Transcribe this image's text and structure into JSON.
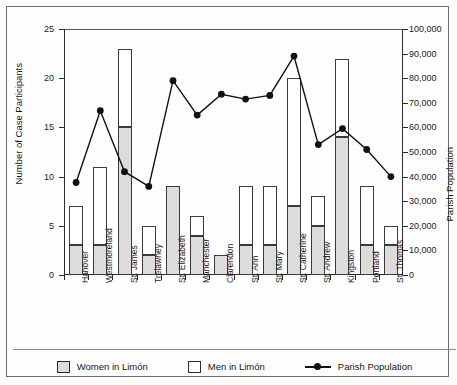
{
  "chart_data": {
    "type": "bar",
    "title": "",
    "xlabel": "",
    "ylabel": "Number of Case Participants",
    "y2label": "Parish Population",
    "ylim": [
      0,
      25
    ],
    "y2lim": [
      0,
      100000
    ],
    "yticks": [
      0,
      5,
      10,
      15,
      20,
      25
    ],
    "y2ticks": [
      0,
      10000,
      20000,
      30000,
      40000,
      50000,
      60000,
      70000,
      80000,
      90000,
      100000
    ],
    "y2ticklabels": [
      "0",
      "10,000",
      "20,000",
      "30,000",
      "40,000",
      "50,000",
      "60,000",
      "70,000",
      "80,000",
      "90,000",
      "100,000"
    ],
    "grid": false,
    "legend_position": "bottom",
    "stacked": true,
    "categories": [
      "Hanover",
      "Westmoreland",
      "St. James",
      "Trelawney",
      "St. Elizabeth",
      "Manchester",
      "Clarendon",
      "St. Ann",
      "St. Mary",
      "St. Catherine",
      "St. Andrew",
      "Kingston",
      "Portland",
      "St. Thomas"
    ],
    "series": [
      {
        "name": "Women in Limón",
        "axis": "left",
        "type": "bar",
        "color": "#dcdcdc",
        "values": [
          3,
          3,
          15,
          2,
          9,
          4,
          2,
          3,
          3,
          7,
          5,
          14,
          3,
          3
        ]
      },
      {
        "name": "Men in Limón",
        "axis": "left",
        "type": "bar",
        "color": "#ffffff",
        "values": [
          4,
          8,
          8,
          3,
          0,
          2,
          0,
          6,
          6,
          13,
          3,
          8,
          6,
          2
        ]
      },
      {
        "name": "Parish Population",
        "axis": "right",
        "type": "line",
        "color": "#111111",
        "values": [
          37600,
          66800,
          42000,
          36000,
          79000,
          65000,
          73500,
          71500,
          73000,
          89000,
          53000,
          59500,
          51000,
          40000
        ]
      }
    ],
    "totals": [
      7,
      11,
      23,
      5,
      9,
      6,
      2,
      9,
      9,
      20,
      8,
      22,
      9,
      5
    ]
  },
  "axes": {
    "left_title": "Number of Case Participants",
    "right_title": "Parish Population",
    "left_ticks": [
      "25",
      "20",
      "15",
      "10",
      "5",
      "0"
    ],
    "right_ticks": [
      "100,000",
      "90,000",
      "80,000",
      "70,000",
      "60,000",
      "50,000",
      "40,000",
      "30,000",
      "20,000",
      "10,000",
      "0"
    ]
  },
  "legend": {
    "items": [
      {
        "label": "Women in Limón",
        "swatch": "women-swatch"
      },
      {
        "label": "Men in Limón",
        "swatch": "men-swatch"
      },
      {
        "label": "Parish Population",
        "swatch": "line-marker-swatch"
      }
    ]
  }
}
